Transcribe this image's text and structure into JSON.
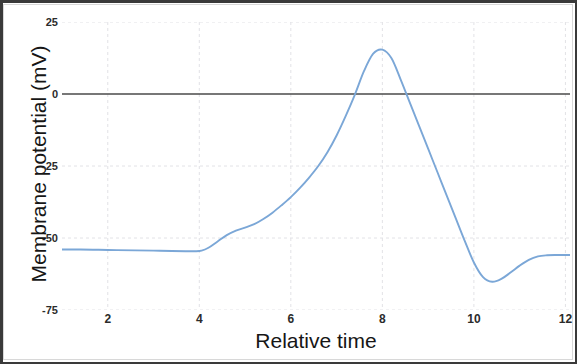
{
  "chart_data": {
    "type": "line",
    "title": "",
    "xlabel": "Relative time",
    "ylabel": "Membrane potential (mV)",
    "xlim": [
      1.0,
      12.1
    ],
    "ylim": [
      -75,
      25
    ],
    "xticks": [
      "2",
      "4",
      "6",
      "8",
      "10",
      "12"
    ],
    "xtick_values": [
      2,
      4,
      6,
      8,
      10,
      12
    ],
    "yticks": [
      "25",
      "0",
      "-25",
      "-50",
      "-75"
    ],
    "ytick_values": [
      25,
      0,
      -25,
      -50,
      -75
    ],
    "grid": "dashed light gridlines at ticks",
    "legend": "none",
    "zero_line": 0,
    "line_color": "#7ba7d7",
    "zero_line_color": "#4a4a4a",
    "grid_color": "#e2e2e6",
    "series": [
      {
        "name": "Membrane potential",
        "x": [
          1.0,
          1.4,
          1.8,
          2.2,
          2.6,
          3.0,
          3.4,
          3.7,
          3.9,
          4.05,
          4.2,
          4.4,
          4.6,
          4.8,
          5.0,
          5.2,
          5.4,
          5.6,
          5.8,
          6.0,
          6.2,
          6.4,
          6.6,
          6.8,
          7.0,
          7.2,
          7.4,
          7.6,
          7.8,
          8.0,
          8.2,
          8.4,
          8.6,
          8.8,
          9.0,
          9.2,
          9.4,
          9.6,
          9.8,
          10.0,
          10.2,
          10.4,
          10.6,
          10.8,
          11.0,
          11.2,
          11.4,
          11.6,
          11.8,
          12.0,
          12.1
        ],
        "y": [
          -54.0,
          -54.0,
          -54.1,
          -54.2,
          -54.3,
          -54.4,
          -54.5,
          -54.6,
          -54.6,
          -54.4,
          -53.4,
          -51.2,
          -49.0,
          -47.4,
          -46.4,
          -45.2,
          -43.4,
          -41.2,
          -38.6,
          -35.8,
          -32.6,
          -29.0,
          -25.0,
          -20.2,
          -14.4,
          -7.6,
          -0.2,
          8.0,
          14.0,
          15.4,
          12.4,
          5.0,
          -3.0,
          -11.0,
          -19.0,
          -27.0,
          -35.0,
          -43.0,
          -51.0,
          -58.5,
          -63.6,
          -65.2,
          -64.2,
          -62.0,
          -59.6,
          -57.6,
          -56.4,
          -56.0,
          -55.9,
          -55.9,
          -55.9
        ]
      }
    ],
    "annotations": {
      "resting_potential": -54,
      "threshold_shoulder": -46.4,
      "peak_value": 15.4,
      "peak_time": 7.7,
      "undershoot_value": -65.2,
      "undershoot_time": 10.4,
      "final_value": -55.9
    }
  },
  "axis": {
    "y_title": "Membrane potential (mV)",
    "x_title": "Relative time"
  }
}
